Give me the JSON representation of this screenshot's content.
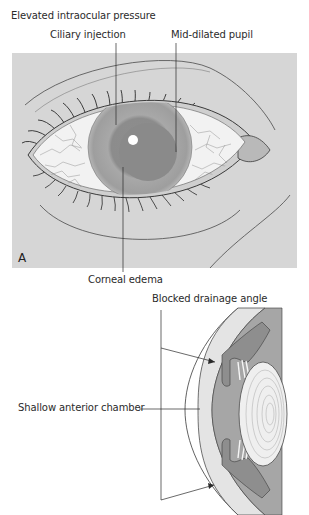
{
  "figure": {
    "panel_a": {
      "letter": "A",
      "labels": {
        "elevated_pressure": "Elevated intraocular pressure",
        "ciliary_injection": "Ciliary injection",
        "mid_dilated_pupil": "Mid-dilated pupil",
        "corneal_edema": "Corneal edema"
      },
      "colors": {
        "background": "#d6d6d6",
        "sclera": "#f2f2f2",
        "iris": "#9a9a9a",
        "pupil": "#8a8a8a",
        "lines": "#3a3a3a"
      }
    },
    "panel_b": {
      "labels": {
        "blocked_drainage_angle": "Blocked drainage angle",
        "shallow_anterior_chamber": "Shallow anterior chamber"
      },
      "colors": {
        "chamber": "#a6a6a6",
        "cornea": "#e4e4e4",
        "lens": "#efefef",
        "posterior": "#9c9c9c"
      }
    }
  }
}
